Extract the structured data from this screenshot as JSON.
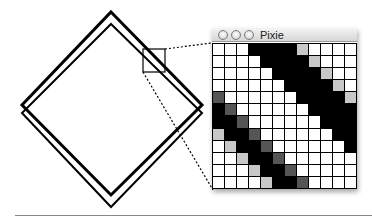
{
  "window": {
    "title": "Pixie",
    "buttons": [
      "close",
      "minimize",
      "zoom"
    ]
  },
  "colors": {
    "W": "#ffffff",
    "L": "#c8c8c8",
    "D": "#555555",
    "B": "#000000"
  },
  "pixel_grid": {
    "columns": 12,
    "rows": 12,
    "cells": [
      "WWWBBBBLWWWW",
      "WWWWBBBBLWWW",
      "WWWWWBBBBLWW",
      "WWWWWWBBBBLW",
      "DWWWWWWBBBBL",
      "BDWWWWWWBBBB",
      "BBDWWWWWWBBB",
      "LBBDWWWWWWBB",
      "WLBBDWWWWWWB",
      "WWLBBDWWWWWW",
      "WWWLBBDWWWWW",
      "WWWWLBBDWWWW"
    ]
  },
  "diagram": {
    "diamonds": [
      {
        "top": [
          111,
          12
        ],
        "right": [
          202,
          105
        ],
        "bottom": [
          111,
          195
        ],
        "left": [
          22,
          105
        ],
        "stroke": 3
      },
      {
        "top": [
          111,
          24
        ],
        "right": [
          202,
          113
        ],
        "bottom": [
          111,
          207
        ],
        "left": [
          22,
          113
        ],
        "stroke": 2
      }
    ],
    "magnifier_box": {
      "x": 143,
      "y": 49,
      "w": 22,
      "h": 23
    },
    "leader_lines": [
      {
        "from": [
          165,
          49
        ],
        "to": [
          212,
          43
        ]
      },
      {
        "from": [
          143,
          72
        ],
        "to": [
          213,
          190
        ]
      }
    ]
  }
}
